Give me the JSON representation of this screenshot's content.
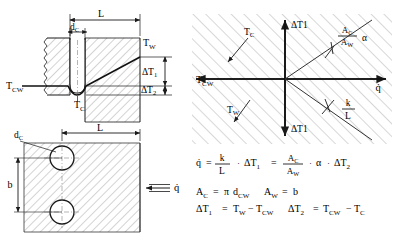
{
  "figure": {
    "stroke_color": "#1a1a1a",
    "hatch_color": "#7a7a7a"
  },
  "panel_top_left": {
    "name": "wall-section-temperature-profile",
    "dim_L": "L",
    "dim_dc": "d",
    "dim_dc_sub": "C",
    "label_TW": "T",
    "label_TW_sub": "W",
    "label_TCW": "T",
    "label_TCW_sub": "CW",
    "label_TC": "T",
    "label_TC_sub": "C",
    "label_dT1": "ΔT",
    "label_dT1_sub": "1",
    "label_dT2": "Δ",
    "label_dT2_main": "T",
    "label_dT2_sub": "2"
  },
  "panel_bottom_left": {
    "name": "channel-cross-section",
    "dim_L": "L",
    "dim_dc": "d",
    "dim_dc_sub": "C",
    "dim_b": "b",
    "label_q": "q̇",
    "arrow_direction": "left"
  },
  "panel_right_graph": {
    "name": "four-quadrant-heat-flux-graph",
    "axis_y_top": "ΔT1",
    "axis_y_bottom": "ΔT1",
    "axis_x_right": "q̇",
    "axis_x_left": "T",
    "axis_x_left_sub": "CW",
    "field_label_TC": "T",
    "field_label_TC_sub": "C",
    "field_label_TW": "T",
    "field_label_TW_sub": "W",
    "slope_upper_num": "A",
    "slope_upper_num_sub": "C",
    "slope_upper_den": "A",
    "slope_upper_den_sub": "W",
    "slope_upper_alpha": "α",
    "slope_lower_num": "k",
    "slope_lower_den": "L"
  },
  "equations": {
    "eq1": {
      "lhs": "q̇",
      "eq1_sign": "=",
      "frac1_num": "k",
      "frac1_den": "L",
      "dot1": "·",
      "term_dT1": "ΔT",
      "term_dT1_sub": "1",
      "eq2_sign": "=",
      "frac2_num": "A",
      "frac2_num_sub": "C",
      "frac2_den": "A",
      "frac2_den_sub": "W",
      "dot2": "·",
      "alpha": "α",
      "dot3": "·",
      "term_dT2": "ΔT",
      "term_dT2_sub": "2"
    },
    "eq2": {
      "lhs_A": "A",
      "lhs_A_sub": "C",
      "eq_sign": "=",
      "pi": "π",
      "d": "d",
      "d_sub": "CW",
      "rhs_A": "A",
      "rhs_A_sub": "W",
      "eq_sign2": "=",
      "b": "b"
    },
    "eq3": {
      "dT1": "ΔT",
      "dT1_sub": "1",
      "eq_sign": "=",
      "TW": "T",
      "TW_sub": "W",
      "minus": "−",
      "TCW": "T",
      "TCW_sub": "CW",
      "dT2": "ΔT",
      "dT2_sub": "2",
      "eq_sign2": "=",
      "TCW2": "T",
      "TCW2_sub": "CW",
      "minus2": "−",
      "TC": "T",
      "TC_sub": "C"
    }
  }
}
